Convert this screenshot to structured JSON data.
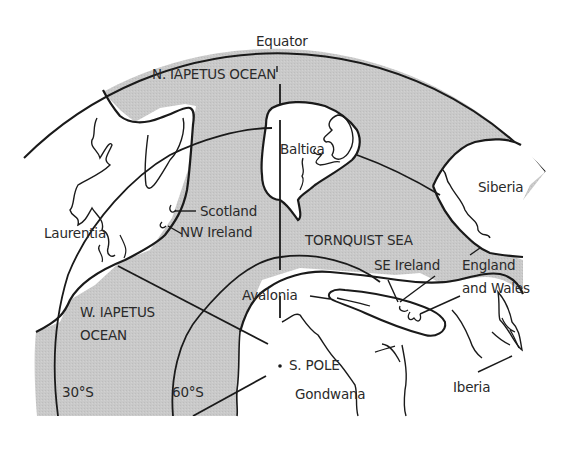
{
  "figure": {
    "type": "palaeogeographic-map",
    "colors": {
      "ocean_fill": "#c8c8c8",
      "land_fill": "#ffffff",
      "line": "#1a1a1a",
      "text": "#2a2a2a"
    }
  },
  "lines": {
    "equator": "Equator",
    "lat_30": "30°S",
    "lat_60": "60°S",
    "pole": "S. POLE"
  },
  "oceans": {
    "n_iapetus": "N. IAPETUS OCEAN",
    "w_iapetus_line1": "W. IAPETUS",
    "w_iapetus_line2": "OCEAN",
    "tornquist": "TORNQUIST SEA"
  },
  "continents": {
    "laurentia": "Laurentia",
    "baltica": "Baltica",
    "siberia": "Siberia",
    "avalonia": "Avalonia",
    "gondwana": "Gondwana",
    "iberia": "Iberia"
  },
  "regions": {
    "scotland": "Scotland",
    "nw_ireland": "NW Ireland",
    "se_ireland": "SE Ireland",
    "england_line1": "England",
    "england_line2": "and  Wales"
  }
}
